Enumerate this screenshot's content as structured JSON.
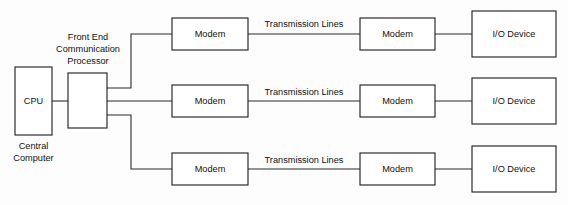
{
  "diagram": {
    "colors": {
      "background": "#fdfdfd",
      "box_fill": "#ffffff",
      "box_stroke": "#1a1a1a",
      "line_stroke": "#2a2a2a",
      "text": "#101010"
    },
    "nodes": {
      "cpu": {
        "label": "CPU",
        "caption_line1": "Central",
        "caption_line2": "Computer"
      },
      "fep": {
        "caption_line1": "Front End",
        "caption_line2": "Communication",
        "caption_line3": "Processor"
      },
      "modem_near_1": {
        "label": "Modem"
      },
      "modem_near_2": {
        "label": "Modem"
      },
      "modem_near_3": {
        "label": "Modem"
      },
      "modem_far_1": {
        "label": "Modem"
      },
      "modem_far_2": {
        "label": "Modem"
      },
      "modem_far_3": {
        "label": "Modem"
      },
      "io_device_1": {
        "label": "I/O Device"
      },
      "io_device_2": {
        "label": "I/O Device"
      },
      "io_device_3": {
        "label": "I/O Device"
      }
    },
    "link_labels": {
      "transmission_1": "Transmission Lines",
      "transmission_2": "Transmission Lines",
      "transmission_3": "Transmission Lines"
    }
  }
}
